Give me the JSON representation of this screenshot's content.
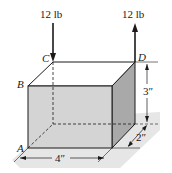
{
  "figure": {
    "type": "3D box with applied forces (statics couple problem)",
    "forces": [
      {
        "label": "12 lb",
        "point": "C",
        "direction": "down"
      },
      {
        "label": "12 lb",
        "point": "D",
        "direction": "up"
      }
    ],
    "points": {
      "A": "A",
      "B": "B",
      "C": "C",
      "D": "D"
    },
    "dimensions": {
      "width": "4″",
      "height": "3″",
      "depth": "2″"
    },
    "colors": {
      "front_face": "#d4d4d4",
      "side_face": "#a9a9a9",
      "top_face": "#ffffff",
      "ground": "#e6e6e6",
      "line": "#1a1a1a"
    }
  }
}
